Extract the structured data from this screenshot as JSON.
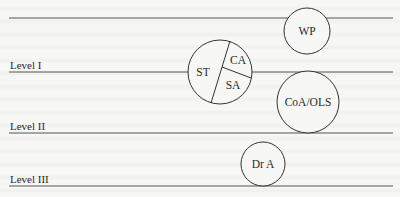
{
  "diagram": {
    "levels": [
      {
        "id": "level-1",
        "label": "Level I",
        "line_y": 72
      },
      {
        "id": "level-2",
        "label": "Level II",
        "line_y": 133
      },
      {
        "id": "level-3",
        "label": "Level III",
        "line_y": 186
      }
    ],
    "top_line_y": 18,
    "nodes": [
      {
        "id": "wp",
        "label": "WP"
      },
      {
        "id": "st",
        "label": "ST"
      },
      {
        "id": "ca",
        "label": "CA"
      },
      {
        "id": "sa",
        "label": "SA"
      },
      {
        "id": "coa-ols",
        "label": "CoA/OLS"
      },
      {
        "id": "dr-a",
        "label": "Dr A"
      }
    ]
  },
  "colors": {
    "line": "#4a4a4a",
    "text": "#2a2a2a",
    "background": "#f7f7f5"
  }
}
